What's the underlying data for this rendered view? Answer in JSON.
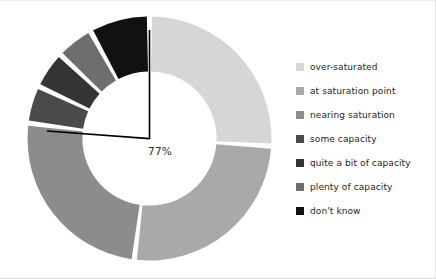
{
  "chart_data": {
    "type": "pie",
    "variant": "donut",
    "title": "",
    "subtitle": "",
    "xlabel": "",
    "ylabel": "",
    "grid": false,
    "legend_position": "right",
    "start_angle_deg": 0,
    "direction": "clockwise",
    "gap_deg": 2.5,
    "inner_radius_ratio": 0.55,
    "categories": [
      "over-saturated",
      "at saturation point",
      "nearing saturation",
      "some capacity",
      "quite a bit of capacity",
      "plenty of capacity",
      "don't know"
    ],
    "values": [
      26,
      26,
      25,
      5,
      5,
      5,
      8
    ],
    "colors": [
      "#d6d6d6",
      "#a9a9a9",
      "#8c8c8c",
      "#4a4a4a",
      "#343434",
      "#6e6e6e",
      "#111111"
    ],
    "annotations": [
      {
        "text": "77%",
        "describes": "over-saturated + at saturation point + nearing saturation",
        "leader": "L-shaped bracket from 12 o'clock down to centre then out to the left"
      }
    ]
  },
  "annotation": {
    "percent_label": "77%"
  },
  "legend": {
    "items": [
      {
        "label": "over-saturated",
        "color": "#d6d6d6"
      },
      {
        "label": "at saturation point",
        "color": "#a9a9a9"
      },
      {
        "label": "nearing saturation",
        "color": "#8c8c8c"
      },
      {
        "label": "some capacity",
        "color": "#4a4a4a"
      },
      {
        "label": "quite a bit of capacity",
        "color": "#343434"
      },
      {
        "label": "plenty of capacity",
        "color": "#6e6e6e"
      },
      {
        "label": "don't know",
        "color": "#111111"
      }
    ]
  }
}
